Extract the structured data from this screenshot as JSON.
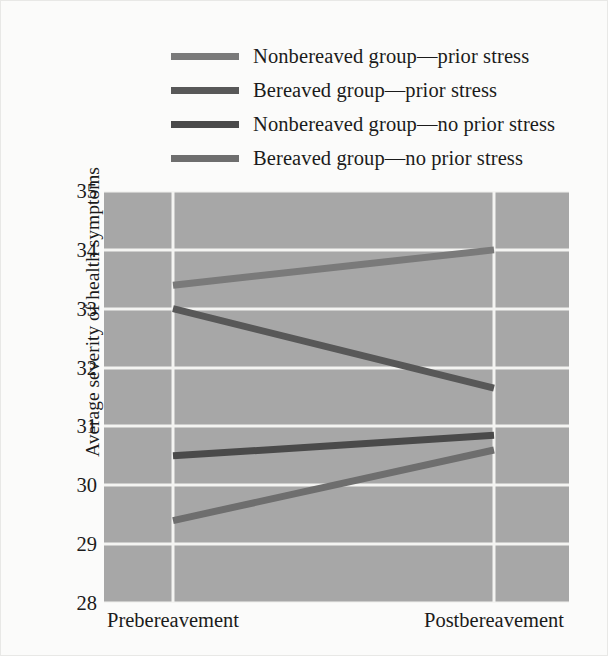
{
  "chart_data": {
    "type": "line",
    "title": "",
    "xlabel": "",
    "ylabel": "Average severity of health symptoms",
    "categories": [
      "Prebereavement",
      "Postbereavement"
    ],
    "ylim": [
      28,
      35
    ],
    "yticks": [
      28,
      29,
      30,
      31,
      32,
      33,
      34,
      35
    ],
    "ytick_labels": [
      "28",
      "29",
      "30",
      "31",
      "32",
      "33",
      "34",
      "35"
    ],
    "grid": true,
    "legend_position": "above-plot",
    "plot_background": "#a7a7a7",
    "gridline_color": "#f4f4f2",
    "series": [
      {
        "name": "Nonbereaved group—prior stress",
        "values": [
          33.4,
          34.0
        ],
        "color": "#7a7a7a"
      },
      {
        "name": "Bereaved group—prior stress",
        "values": [
          33.0,
          31.65
        ],
        "color": "#585858"
      },
      {
        "name": "Nonbereaved group—no prior stress",
        "values": [
          30.5,
          30.85
        ],
        "color": "#4a4a4a"
      },
      {
        "name": "Bereaved group—no prior stress",
        "values": [
          29.4,
          30.6
        ],
        "color": "#6e6e6e"
      }
    ]
  },
  "legend": {
    "items": [
      {
        "label": "Nonbereaved group—prior stress",
        "color": "#7a7a7a"
      },
      {
        "label": "Bereaved group—prior stress",
        "color": "#585858"
      },
      {
        "label": "Nonbereaved group—no prior stress",
        "color": "#4a4a4a"
      },
      {
        "label": "Bereaved group—no prior stress",
        "color": "#6e6e6e"
      }
    ]
  }
}
